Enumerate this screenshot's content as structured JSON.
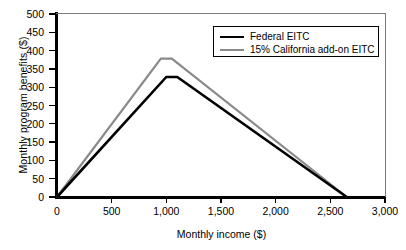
{
  "chart_data": {
    "type": "line",
    "title": "",
    "xlabel": "Monthly income ($)",
    "ylabel": "Monthly program benefits ($)",
    "xlim": [
      0,
      3000
    ],
    "ylim": [
      0,
      500
    ],
    "xticks": [
      0,
      500,
      1000,
      1500,
      2000,
      2500,
      3000
    ],
    "xticklabels": [
      "0",
      "500",
      "1,000",
      "1,500",
      "2,000",
      "2,500",
      "3,000"
    ],
    "yticks": [
      0,
      50,
      100,
      150,
      200,
      250,
      300,
      350,
      400,
      450,
      500
    ],
    "yticklabels": [
      "0",
      "50",
      "100",
      "150",
      "200",
      "250",
      "300",
      "350",
      "400",
      "450",
      "500"
    ],
    "grid": false,
    "legend_position": "upper right",
    "series": [
      {
        "name": "Federal EITC",
        "color": "#000000",
        "x": [
          0,
          1000,
          1100,
          2650
        ],
        "y": [
          0,
          328,
          328,
          0
        ]
      },
      {
        "name": "15% California add-on EITC",
        "color": "#8a8a8a",
        "x": [
          0,
          950,
          1050,
          2650
        ],
        "y": [
          0,
          378,
          378,
          0
        ]
      }
    ]
  },
  "legend": {
    "items": [
      {
        "label": "Federal EITC",
        "swatch": "black"
      },
      {
        "label": "15% California add-on EITC",
        "swatch": "gray"
      }
    ]
  }
}
